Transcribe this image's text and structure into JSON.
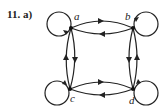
{
  "problem_label": "11. a)",
  "graph": {
    "type": "directed",
    "nodes": [
      {
        "id": "a",
        "label": "a",
        "x": 71,
        "y": 28
      },
      {
        "id": "b",
        "label": "b",
        "x": 133,
        "y": 28
      },
      {
        "id": "c",
        "label": "c",
        "x": 70,
        "y": 89
      },
      {
        "id": "d",
        "label": "d",
        "x": 133,
        "y": 89
      }
    ],
    "edges": [
      {
        "from": "a",
        "to": "a",
        "kind": "loop"
      },
      {
        "from": "b",
        "to": "b",
        "kind": "loop"
      },
      {
        "from": "c",
        "to": "c",
        "kind": "loop"
      },
      {
        "from": "d",
        "to": "d",
        "kind": "loop"
      },
      {
        "from": "a",
        "to": "b"
      },
      {
        "from": "b",
        "to": "a"
      },
      {
        "from": "a",
        "to": "c"
      },
      {
        "from": "c",
        "to": "a"
      },
      {
        "from": "b",
        "to": "d"
      },
      {
        "from": "d",
        "to": "b"
      },
      {
        "from": "c",
        "to": "d"
      },
      {
        "from": "d",
        "to": "c"
      }
    ]
  }
}
